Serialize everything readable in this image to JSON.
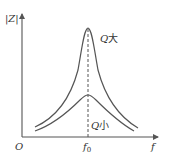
{
  "diagram": {
    "title": "",
    "axes": {
      "y_label": "|Z|",
      "x_label": "f",
      "origin_label": "O",
      "center_tick_label": "f",
      "center_tick_sub": "0"
    },
    "curves": [
      {
        "name": "high-q",
        "label_q": "Q",
        "label_cn": "大"
      },
      {
        "name": "low-q",
        "label_q": "Q",
        "label_cn": "小"
      }
    ],
    "colors": {
      "line": "#555555",
      "text": "#333333",
      "background": "#ffffff"
    }
  }
}
